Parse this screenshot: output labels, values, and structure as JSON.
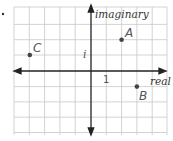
{
  "diagram": {
    "type": "complex-plane",
    "problem_marker": ".",
    "axes": {
      "horizontal_label": "real",
      "vertical_label": "imaginary",
      "real_unit_label": "1",
      "imaginary_unit_label": "i"
    },
    "grid": {
      "x_range": [
        -5,
        5
      ],
      "y_range": [
        -4,
        4
      ]
    },
    "points": [
      {
        "label": "A",
        "re": 2,
        "im": 2
      },
      {
        "label": "B",
        "re": 3,
        "im": -1
      },
      {
        "label": "C",
        "re": -4,
        "im": 1
      }
    ],
    "colors": {
      "grid": "#c8c8c8",
      "axis": "#222222",
      "point": "#444444",
      "label": "#555555"
    }
  }
}
